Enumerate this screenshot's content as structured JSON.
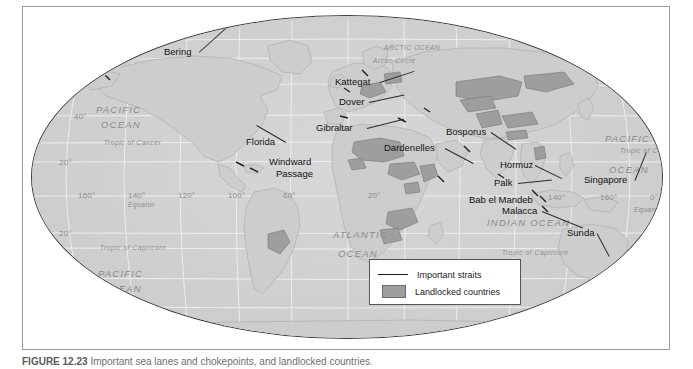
{
  "figure": {
    "caption_prefix": "FIGURE 12.23",
    "caption_text": "Important sea lanes and chokepoints, and landlocked countries."
  },
  "map": {
    "title": "World map of important straits and landlocked countries",
    "projection": "Robinson",
    "colors": {
      "ocean": "#d2d2d2",
      "land": "#cfcfcf",
      "landlocked": "#9e9e9e",
      "graticule": "#eeeeee",
      "outline": "#3c3c3c",
      "label": "#111111",
      "ocean_label": "#8a8a8a",
      "tick_label": "#8d8d8d",
      "frame": "#9a9a9a"
    },
    "straits": [
      {
        "name": "Bering",
        "label_x": 132,
        "label_y": 30,
        "leader_len": 46,
        "leader_angle": 42,
        "align": "left"
      },
      {
        "name": "Kattegat",
        "label_x": 303,
        "label_y": 60,
        "leader_len": 36,
        "leader_angle": 18,
        "align": "left"
      },
      {
        "name": "Dover",
        "label_x": 307,
        "label_y": 80,
        "leader_len": 36,
        "leader_angle": 12,
        "align": "left"
      },
      {
        "name": "Gibraltar",
        "label_x": 284,
        "label_y": 106,
        "leader_len": 38,
        "leader_angle": 14,
        "align": "left"
      },
      {
        "name": "Florida",
        "label_x": 214,
        "label_y": 120,
        "leader_len": 34,
        "leader_angle": 150,
        "align": "left"
      },
      {
        "name": "Windward",
        "label_x": 237,
        "label_y": 140,
        "leader_len": 0,
        "leader_angle": 0,
        "align": "left"
      },
      {
        "name": "Passage",
        "label_x": 244,
        "label_y": 152,
        "leader_len": 0,
        "leader_angle": 0,
        "align": "left"
      },
      {
        "name": "Dardenelles",
        "label_x": 352,
        "label_y": 126,
        "leader_len": 32,
        "leader_angle": -28,
        "align": "left"
      },
      {
        "name": "Bosporus",
        "label_x": 414,
        "label_y": 110,
        "leader_len": 30,
        "leader_angle": -34,
        "align": "left"
      },
      {
        "name": "Hormuz",
        "label_x": 468,
        "label_y": 143,
        "leader_len": 30,
        "leader_angle": -26,
        "align": "left"
      },
      {
        "name": "Palk",
        "label_x": 462,
        "label_y": 161,
        "leader_len": 34,
        "leader_angle": 6,
        "align": "left"
      },
      {
        "name": "Bab el Mandeb",
        "label_x": 437,
        "label_y": 178,
        "leader_len": 0,
        "leader_angle": 0,
        "align": "left"
      },
      {
        "name": "Malacca",
        "label_x": 470,
        "label_y": 189,
        "leader_len": 44,
        "leader_angle": -22,
        "align": "left"
      },
      {
        "name": "Singapore",
        "label_x": 552,
        "label_y": 158,
        "leader_len": 30,
        "leader_angle": 68,
        "align": "left"
      },
      {
        "name": "Sunda",
        "label_x": 535,
        "label_y": 211,
        "leader_len": 26,
        "leader_angle": -62,
        "align": "left"
      }
    ],
    "ocean_labels": [
      {
        "text": "ARCTIC OCEAN",
        "x": 352,
        "y": 28,
        "size": "sm"
      },
      {
        "text": "Arctic Circle",
        "x": 341,
        "y": 41,
        "size": "sm"
      },
      {
        "text": "PACIFIC",
        "x": 64,
        "y": 88,
        "size": "big"
      },
      {
        "text": "OCEAN",
        "x": 69,
        "y": 103,
        "size": "big"
      },
      {
        "text": "Tropic of Cancer",
        "x": 72,
        "y": 123,
        "size": "sm"
      },
      {
        "text": "Equator",
        "x": 96,
        "y": 185,
        "size": "sm"
      },
      {
        "text": "Tropic of Capricorn",
        "x": 68,
        "y": 228,
        "size": "sm"
      },
      {
        "text": "PACIFIC",
        "x": 66,
        "y": 252,
        "size": "big"
      },
      {
        "text": "OCEAN",
        "x": 70,
        "y": 267,
        "size": "big"
      },
      {
        "text": "Antarctic Circle",
        "x": 104,
        "y": 305,
        "size": "sm"
      },
      {
        "text": "ATLANTIC",
        "x": 301,
        "y": 213,
        "size": "big"
      },
      {
        "text": "OCEAN",
        "x": 306,
        "y": 232,
        "size": "big"
      },
      {
        "text": "INDIAN  OCEAN",
        "x": 455,
        "y": 201,
        "size": "big"
      },
      {
        "text": "PACIFIC",
        "x": 573,
        "y": 117,
        "size": "big"
      },
      {
        "text": "OCEAN",
        "x": 577,
        "y": 148,
        "size": "big"
      },
      {
        "text": "Tropic of Cancer",
        "x": 588,
        "y": 131,
        "size": "sm"
      },
      {
        "text": "Equator",
        "x": 602,
        "y": 190,
        "size": "sm"
      },
      {
        "text": "Tropic of Capricorn",
        "x": 470,
        "y": 233,
        "size": "sm"
      },
      {
        "text": "Antarctic Circle",
        "x": 547,
        "y": 306,
        "size": "sm"
      }
    ],
    "ticks": [
      {
        "text": "80°",
        "x": 78,
        "y": 22
      },
      {
        "text": "80°",
        "x": 534,
        "y": 24
      },
      {
        "text": "40°",
        "x": 42,
        "y": 96
      },
      {
        "text": "20°",
        "x": 27,
        "y": 142
      },
      {
        "text": "160°",
        "x": 46,
        "y": 175
      },
      {
        "text": "140°",
        "x": 96,
        "y": 175
      },
      {
        "text": "120°",
        "x": 146,
        "y": 175
      },
      {
        "text": "100°",
        "x": 196,
        "y": 175
      },
      {
        "text": "20°",
        "x": 27,
        "y": 213
      },
      {
        "text": "40°",
        "x": 45,
        "y": 258
      },
      {
        "text": "60°",
        "x": 90,
        "y": 296
      },
      {
        "text": "60°",
        "x": 251,
        "y": 175
      },
      {
        "text": "20°",
        "x": 336,
        "y": 175
      },
      {
        "text": "40°",
        "x": 636,
        "y": 99
      },
      {
        "text": "20°",
        "x": 652,
        "y": 143
      },
      {
        "text": "140°",
        "x": 516,
        "y": 177
      },
      {
        "text": "160°",
        "x": 568,
        "y": 177
      },
      {
        "text": "0°",
        "x": 618,
        "y": 177
      },
      {
        "text": "20°",
        "x": 650,
        "y": 209
      },
      {
        "text": "40°",
        "x": 634,
        "y": 255
      },
      {
        "text": "60°",
        "x": 592,
        "y": 292
      }
    ]
  },
  "legend": {
    "items": [
      {
        "label": "Important straits",
        "symbol": "line"
      },
      {
        "label": "Landlocked countries",
        "symbol": "swatch"
      }
    ]
  }
}
